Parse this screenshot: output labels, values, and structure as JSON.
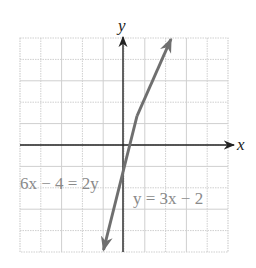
{
  "chart_data": {
    "type": "line",
    "title": "",
    "xlabel": "x",
    "ylabel": "y",
    "xlim": [
      -5,
      5
    ],
    "ylim": [
      -5,
      5
    ],
    "grid": true,
    "series": [
      {
        "name": "y = 3x − 2",
        "equation": "y = 3x − 2",
        "alt_equation": "6x − 4 = 2y",
        "slope": 3,
        "intercept": -2,
        "x": [
          -1,
          0,
          0.667,
          2.333
        ],
        "y": [
          -5,
          -2,
          0,
          5
        ],
        "color": "#7a7a7a"
      }
    ],
    "annotations": [
      {
        "text": "6x − 4 = 2y",
        "x": -5,
        "y": -2
      },
      {
        "text": "y = 3x − 2",
        "x": 0.2,
        "y": -2.6
      }
    ]
  },
  "labels": {
    "x_axis": "x",
    "y_axis": "y",
    "eq_left": "6x − 4 = 2y",
    "eq_right": "y = 3x − 2"
  },
  "colors": {
    "grid": "#c8c8c8",
    "axis": "#222222",
    "line": "#7a7a7a",
    "label": "#8a8a8a"
  }
}
